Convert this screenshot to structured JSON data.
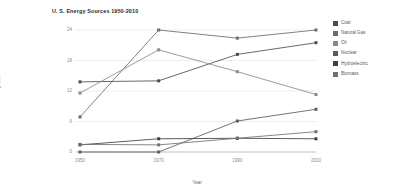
{
  "chart_data": {
    "type": "line",
    "title": "U. S. Energy Sources 1950-2010",
    "xlabel": "Year",
    "ylabel": "Quads",
    "categories": [
      "1950",
      "1970",
      "1990",
      "2010"
    ],
    "x": [
      1950,
      1970,
      1990,
      2010
    ],
    "xlim": [
      1950,
      2010
    ],
    "ylim": [
      0,
      24
    ],
    "yticks": [
      "0",
      "6",
      "12",
      "18",
      "24"
    ],
    "ytick_values": [
      0,
      6,
      12,
      18,
      24
    ],
    "grid": true,
    "grid_axis": "y",
    "legend_position": "right",
    "series": [
      {
        "name": "Coal",
        "color": "#4d4d4d",
        "values": [
          13.8,
          14.0,
          19.2,
          21.5
        ]
      },
      {
        "name": "Natural Gas",
        "color": "#6b6b6b",
        "values": [
          6.9,
          24.0,
          22.4,
          24.0
        ]
      },
      {
        "name": "Oil",
        "color": "#8a8a8a",
        "values": [
          11.6,
          20.1,
          15.8,
          11.3
        ]
      },
      {
        "name": "Nuclear",
        "color": "#5c5c5c",
        "values": [
          0.0,
          0.0,
          6.1,
          8.4
        ]
      },
      {
        "name": "Hydroelectric",
        "color": "#3f3f3f",
        "values": [
          1.4,
          2.6,
          2.7,
          2.6
        ]
      },
      {
        "name": "Biomass",
        "color": "#707070",
        "values": [
          1.5,
          1.4,
          2.7,
          4.0
        ]
      }
    ]
  },
  "legend": {
    "items": [
      {
        "label": "Coal"
      },
      {
        "label": "Natural Gas"
      },
      {
        "label": "Oil"
      },
      {
        "label": "Nuclear"
      },
      {
        "label": "Hydroelectric"
      },
      {
        "label": "Biomass"
      }
    ]
  }
}
